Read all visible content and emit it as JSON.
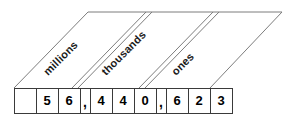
{
  "diagram": {
    "type": "place-value-chart",
    "number_displayed": "56,440,623",
    "colors": {
      "guide_line": "#7d7d7d",
      "cell_border": "#3a3a3a",
      "text": "#000000",
      "background": "#ffffff"
    },
    "periods": [
      {
        "label": "millions"
      },
      {
        "label": "thousands"
      },
      {
        "label": "ones"
      }
    ],
    "cells": [
      {
        "value": "",
        "kind": "digit",
        "width": 22
      },
      {
        "value": "5",
        "kind": "digit",
        "width": 22
      },
      {
        "value": "6",
        "kind": "digit",
        "width": 22
      },
      {
        "value": ",",
        "kind": "comma",
        "width": 10
      },
      {
        "value": "4",
        "kind": "digit",
        "width": 22
      },
      {
        "value": "4",
        "kind": "digit",
        "width": 22
      },
      {
        "value": "0",
        "kind": "digit",
        "width": 22
      },
      {
        "value": ",",
        "kind": "comma",
        "width": 10
      },
      {
        "value": "6",
        "kind": "digit",
        "width": 22
      },
      {
        "value": "2",
        "kind": "digit",
        "width": 22
      },
      {
        "value": "3",
        "kind": "digit",
        "width": 22
      }
    ]
  }
}
